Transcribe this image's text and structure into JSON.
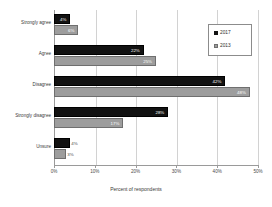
{
  "chart_data": {
    "type": "bar",
    "orientation": "horizontal",
    "title": "",
    "xlabel": "Percent of respondents",
    "ylabel": "",
    "xlim": [
      0,
      50
    ],
    "xticks": [
      "0%",
      "10%",
      "20%",
      "30%",
      "40%",
      "50%"
    ],
    "xtick_values": [
      0,
      10,
      20,
      30,
      40,
      50
    ],
    "grid": true,
    "legend_position": "top-right",
    "categories": [
      "Strongly agree",
      "Agree",
      "Disagree",
      "Strongly disagree",
      "Unsure"
    ],
    "series": [
      {
        "name": "2017",
        "color": "#121212",
        "values": [
          4,
          22,
          42,
          28,
          4
        ],
        "labels": [
          "4%",
          "22%",
          "42%",
          "28%",
          "4%"
        ],
        "label_placement": [
          "inside",
          "inside",
          "inside",
          "inside",
          "outside"
        ]
      },
      {
        "name": "2013",
        "color": "#9d9d9d",
        "values": [
          6,
          25,
          48,
          17,
          3
        ],
        "labels": [
          "6%",
          "25%",
          "48%",
          "17%",
          "3%"
        ],
        "label_placement": [
          "inside",
          "inside",
          "inside",
          "inside",
          "outside"
        ]
      }
    ]
  },
  "legend": {
    "entries": [
      {
        "label": "2017"
      },
      {
        "label": "2013"
      }
    ]
  }
}
